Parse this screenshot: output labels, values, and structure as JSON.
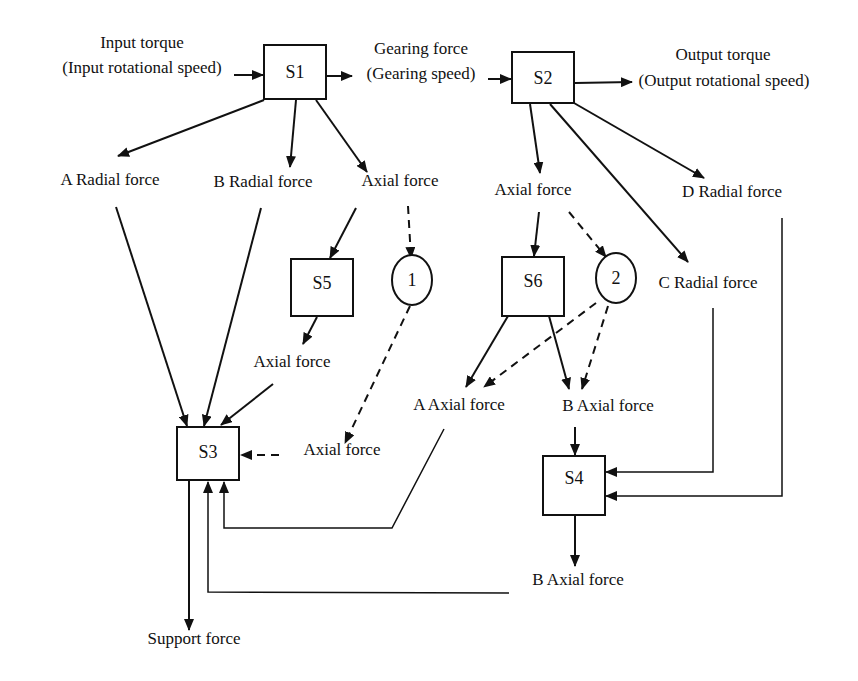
{
  "diagram": {
    "type": "force-transmission flow diagram",
    "nodes": {
      "s1": {
        "label": "S1"
      },
      "s2": {
        "label": "S2"
      },
      "s3": {
        "label": "S3"
      },
      "s4": {
        "label": "S4"
      },
      "s5": {
        "label": "S5"
      },
      "s6": {
        "label": "S6"
      },
      "c1": {
        "label": "1"
      },
      "c2": {
        "label": "2"
      }
    },
    "labels": {
      "input_torque_1": "Input torque",
      "input_torque_2": "(Input rotational speed)",
      "gearing_force_1": "Gearing force",
      "gearing_force_2": "(Gearing speed)",
      "output_torque_1": "Output torque",
      "output_torque_2": "(Output rotational speed)",
      "a_radial_force": "A Radial force",
      "b_radial_force": "B Radial force",
      "axial_force_s1": "Axial force",
      "axial_force_s2": "Axial force",
      "d_radial_force": "D Radial force",
      "c_radial_force": "C Radial force",
      "axial_force_s5": "Axial force",
      "a_axial_force": "A Axial force",
      "b_axial_force_s6": "B Axial force",
      "axial_force_c1": "Axial force",
      "b_axial_force_s4": "B Axial force",
      "support_force": "Support force"
    },
    "edges": [
      {
        "from": "Input torque",
        "to": "S1",
        "style": "solid"
      },
      {
        "from": "S1",
        "to": "Gearing force",
        "style": "solid"
      },
      {
        "from": "Gearing force",
        "to": "S2",
        "style": "solid"
      },
      {
        "from": "S2",
        "to": "Output torque",
        "style": "solid"
      },
      {
        "from": "S1",
        "to": "A Radial force",
        "style": "solid"
      },
      {
        "from": "S1",
        "to": "B Radial force",
        "style": "solid"
      },
      {
        "from": "S1",
        "to": "Axial force (S1)",
        "style": "solid"
      },
      {
        "from": "S2",
        "to": "Axial force (S2)",
        "style": "solid"
      },
      {
        "from": "S2",
        "to": "C Radial force",
        "style": "solid"
      },
      {
        "from": "S2",
        "to": "D Radial force",
        "style": "solid"
      },
      {
        "from": "Axial force (S1)",
        "to": "S5",
        "style": "solid"
      },
      {
        "from": "Axial force (S1)",
        "to": "1",
        "style": "dashed"
      },
      {
        "from": "Axial force (S2)",
        "to": "S6",
        "style": "solid"
      },
      {
        "from": "Axial force (S2)",
        "to": "2",
        "style": "dashed"
      },
      {
        "from": "S5",
        "to": "Axial force (S5)",
        "style": "solid"
      },
      {
        "from": "1",
        "to": "Axial force (1)",
        "style": "dashed"
      },
      {
        "from": "S6",
        "to": "A Axial force",
        "style": "solid"
      },
      {
        "from": "S6",
        "to": "B Axial force",
        "style": "solid"
      },
      {
        "from": "2",
        "to": "A Axial force",
        "style": "dashed"
      },
      {
        "from": "2",
        "to": "B Axial force",
        "style": "dashed"
      },
      {
        "from": "A Radial force",
        "to": "S3",
        "style": "solid"
      },
      {
        "from": "B Radial force",
        "to": "S3",
        "style": "solid"
      },
      {
        "from": "Axial force (S5)",
        "to": "S3",
        "style": "solid"
      },
      {
        "from": "Axial force (1)",
        "to": "S3",
        "style": "dashed"
      },
      {
        "from": "A Axial force",
        "to": "S3",
        "style": "solid"
      },
      {
        "from": "B Axial force",
        "to": "S4",
        "style": "solid"
      },
      {
        "from": "C Radial force",
        "to": "S4",
        "style": "solid"
      },
      {
        "from": "D Radial force",
        "to": "S4",
        "style": "solid"
      },
      {
        "from": "S4",
        "to": "B Axial force (S4)",
        "style": "solid"
      },
      {
        "from": "B Axial force (S4)",
        "to": "S3",
        "style": "solid"
      },
      {
        "from": "S3",
        "to": "Support force",
        "style": "solid"
      }
    ]
  }
}
